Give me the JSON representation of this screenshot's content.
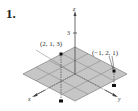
{
  "exercise_number": "1.",
  "diagram": {
    "type": "3d-coordinate-plot",
    "axes": {
      "x": "x",
      "y": "y",
      "z": "z"
    },
    "z_tick": "3",
    "grid": {
      "rows": 4,
      "cols": 4,
      "fill": "#c8c8c8",
      "line": "#8a8a8a"
    },
    "points": [
      {
        "label": "(2, 1, 3)",
        "coords": [
          2,
          1,
          3
        ]
      },
      {
        "label": "(−1, 2, 1)",
        "coords": [
          -1,
          2,
          1
        ]
      }
    ]
  }
}
